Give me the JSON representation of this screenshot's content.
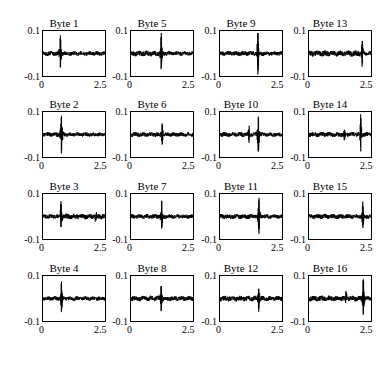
{
  "figure": {
    "grid": {
      "rows": 4,
      "cols": 4
    },
    "axis": {
      "ytick_high": "0.1",
      "ytick_low": "-0.1",
      "xtick_low": "0",
      "xtick_high": "2.5"
    }
  },
  "chart_data": {
    "type": "line",
    "title": "",
    "xlabel": "",
    "ylabel": "",
    "xlim": [
      0,
      2.5
    ],
    "ylim": [
      -0.1,
      0.1
    ],
    "grid": false,
    "legend": null,
    "axis_ticks": {
      "x": [
        0,
        2.5
      ],
      "y": [
        -0.1,
        0.1
      ]
    },
    "layout": {
      "rows": 4,
      "cols": 4,
      "order": "column-major"
    },
    "line_color": "#000000",
    "panels": [
      {
        "title": "Byte 1",
        "row": 1,
        "col": 1,
        "spike_x": 0.72,
        "spike_up": 0.072,
        "spike_down": -0.062,
        "noise": 0.009,
        "pre_noise": 0.009,
        "post_noise": 0.008,
        "minor_spikes": []
      },
      {
        "title": "Byte 2",
        "row": 2,
        "col": 1,
        "spike_x": 0.76,
        "spike_up": 0.088,
        "spike_down": -0.08,
        "noise": 0.009,
        "pre_noise": 0.009,
        "post_noise": 0.008,
        "minor_spikes": []
      },
      {
        "title": "Byte 3",
        "row": 3,
        "col": 1,
        "spike_x": 0.74,
        "spike_up": 0.06,
        "spike_down": -0.052,
        "noise": 0.009,
        "pre_noise": 0.008,
        "post_noise": 0.01,
        "minor_spikes": [
          2.1
        ]
      },
      {
        "title": "Byte 4",
        "row": 4,
        "col": 1,
        "spike_x": 0.76,
        "spike_up": 0.078,
        "spike_down": -0.066,
        "noise": 0.008,
        "pre_noise": 0.008,
        "post_noise": 0.008,
        "minor_spikes": []
      },
      {
        "title": "Byte 5",
        "row": 1,
        "col": 2,
        "spike_x": 1.22,
        "spike_up": 0.082,
        "spike_down": -0.074,
        "noise": 0.009,
        "pre_noise": 0.01,
        "post_noise": 0.008,
        "minor_spikes": []
      },
      {
        "title": "Byte 6",
        "row": 2,
        "col": 2,
        "spike_x": 1.26,
        "spike_up": 0.048,
        "spike_down": -0.044,
        "noise": 0.009,
        "pre_noise": 0.009,
        "post_noise": 0.008,
        "minor_spikes": []
      },
      {
        "title": "Byte 7",
        "row": 3,
        "col": 2,
        "spike_x": 1.24,
        "spike_up": 0.064,
        "spike_down": -0.056,
        "noise": 0.009,
        "pre_noise": 0.009,
        "post_noise": 0.008,
        "minor_spikes": []
      },
      {
        "title": "Byte 8",
        "row": 4,
        "col": 2,
        "spike_x": 1.22,
        "spike_up": 0.055,
        "spike_down": -0.05,
        "noise": 0.01,
        "pre_noise": 0.01,
        "post_noise": 0.009,
        "minor_spikes": []
      },
      {
        "title": "Byte 9",
        "row": 1,
        "col": 3,
        "spike_x": 1.52,
        "spike_up": 0.095,
        "spike_down": -0.085,
        "noise": 0.009,
        "pre_noise": 0.009,
        "post_noise": 0.008,
        "minor_spikes": []
      },
      {
        "title": "Byte 10",
        "row": 2,
        "col": 3,
        "spike_x": 1.54,
        "spike_up": 0.086,
        "spike_down": -0.076,
        "noise": 0.009,
        "pre_noise": 0.009,
        "post_noise": 0.008,
        "minor_spikes": [
          1.18
        ]
      },
      {
        "title": "Byte 11",
        "row": 3,
        "col": 3,
        "spike_x": 1.56,
        "spike_up": 0.08,
        "spike_down": -0.07,
        "noise": 0.009,
        "pre_noise": 0.009,
        "post_noise": 0.008,
        "minor_spikes": []
      },
      {
        "title": "Byte 12",
        "row": 4,
        "col": 3,
        "spike_x": 1.55,
        "spike_up": 0.052,
        "spike_down": -0.046,
        "noise": 0.01,
        "pre_noise": 0.01,
        "post_noise": 0.009,
        "minor_spikes": []
      },
      {
        "title": "Byte 13",
        "row": 1,
        "col": 4,
        "spike_x": 2.12,
        "spike_up": 0.062,
        "spike_down": -0.054,
        "noise": 0.01,
        "pre_noise": 0.011,
        "post_noise": 0.008,
        "minor_spikes": []
      },
      {
        "title": "Byte 14",
        "row": 2,
        "col": 4,
        "spike_x": 2.06,
        "spike_up": 0.082,
        "spike_down": -0.07,
        "noise": 0.009,
        "pre_noise": 0.009,
        "post_noise": 0.008,
        "minor_spikes": [
          1.42
        ]
      },
      {
        "title": "Byte 15",
        "row": 3,
        "col": 4,
        "spike_x": 2.14,
        "spike_up": 0.058,
        "spike_down": -0.052,
        "noise": 0.009,
        "pre_noise": 0.009,
        "post_noise": 0.008,
        "minor_spikes": []
      },
      {
        "title": "Byte 16",
        "row": 4,
        "col": 4,
        "spike_x": 2.16,
        "spike_up": 0.09,
        "spike_down": -0.078,
        "noise": 0.01,
        "pre_noise": 0.01,
        "post_noise": 0.008,
        "minor_spikes": [
          1.48
        ]
      }
    ]
  }
}
